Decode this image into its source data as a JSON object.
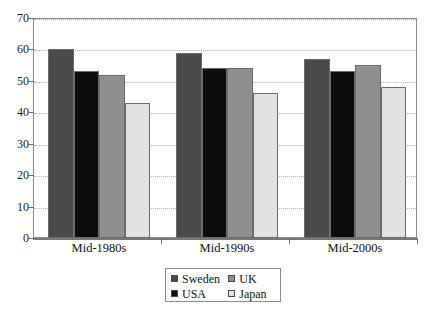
{
  "chart_data": {
    "type": "bar",
    "title": "",
    "subtitle": "",
    "xlabel": "",
    "ylabel": "",
    "categories": [
      "Mid-1980s",
      "Mid-1990s",
      "Mid-2000s"
    ],
    "series": [
      {
        "name": "Sweden",
        "color": "#4a4a4a",
        "values": [
          60,
          59,
          57
        ]
      },
      {
        "name": "USA",
        "color": "#0d0d0d",
        "values": [
          53,
          54,
          53
        ]
      },
      {
        "name": "UK",
        "color": "#8f8f8f",
        "values": [
          52,
          54,
          55
        ]
      },
      {
        "name": "Japan",
        "color": "#e2e2e2",
        "values": [
          43,
          46,
          48
        ]
      }
    ],
    "ylim": [
      0,
      70
    ],
    "ytick_step": 10,
    "ytick_labels": [
      "0",
      "10",
      "20",
      "30",
      "40",
      "50",
      "60",
      "70"
    ],
    "grid": true,
    "grid_style": "dotted-horizontal",
    "legend_position": "bottom-center",
    "legend_entries": [
      "Sweden",
      "UK",
      "USA",
      "Japan"
    ]
  },
  "legend": {
    "row1": {
      "left": "Sweden",
      "right": "UK"
    },
    "row2": {
      "left": "USA",
      "right": "Japan"
    }
  }
}
